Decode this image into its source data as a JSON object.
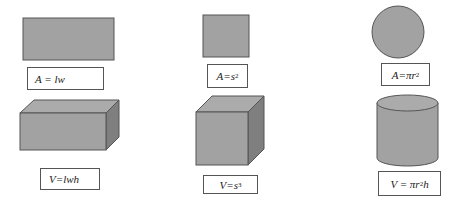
{
  "colors": {
    "fill": "#a2a2a2",
    "top_face": "#ababab",
    "side_face": "#7f7f7f",
    "stroke": "#555555"
  },
  "columns": [
    {
      "name": "rectangle",
      "shape_2d": "rectangle",
      "formula_2d": {
        "main": "A = lw",
        "sup": ""
      },
      "shape_3d": "rectangular-prism",
      "formula_3d": {
        "main": "V=lwh",
        "sup": "",
        "tail": ""
      }
    },
    {
      "name": "square",
      "shape_2d": "square",
      "formula_2d": {
        "main": "A=s",
        "sup": "2"
      },
      "shape_3d": "cube",
      "formula_3d": {
        "main": "V=s",
        "sup": "3",
        "tail": ""
      }
    },
    {
      "name": "circle",
      "shape_2d": "circle",
      "formula_2d": {
        "main": "A=πr",
        "sup": "2"
      },
      "shape_3d": "cylinder",
      "formula_3d": {
        "main": "V = πr",
        "sup": "2",
        "tail": "h"
      }
    }
  ]
}
